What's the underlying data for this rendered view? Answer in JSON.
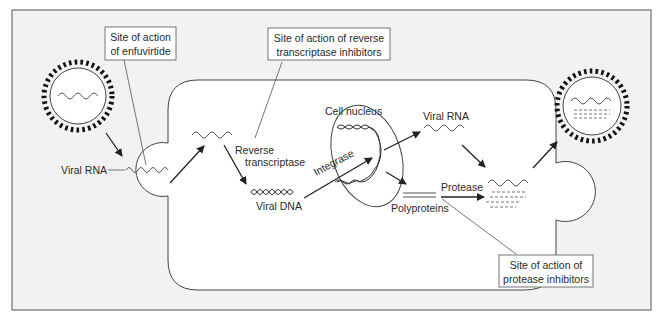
{
  "figure": {
    "type": "HIV life cycle / antiretroviral drug sites of action",
    "colors": {
      "frame_bg": "#f2f2f2",
      "cell_bg": "#ffffff",
      "stroke": "#333333",
      "callout_line": "#666666"
    }
  },
  "callouts": {
    "enfuvirtide": {
      "line1": "Site of action",
      "line2": "of enfuvirtide"
    },
    "reverse_transcriptase_inhibitors": {
      "line1": "Site of action of reverse",
      "line2": "transcriptase inhibitors"
    },
    "protease_inhibitors": {
      "line1": "Site of action of",
      "line2": "protease inhibitors"
    }
  },
  "labels": {
    "viral_rna_entry": "Viral RNA",
    "reverse": "Reverse",
    "transcriptase": "transcriptase",
    "viral_dna": "Viral DNA",
    "integrase": "Integrase",
    "cell_nucleus": "Cell nucleus",
    "viral_rna_out": "Viral RNA",
    "polyproteins": "Polyproteins",
    "protease": "Protease"
  },
  "caption": ""
}
